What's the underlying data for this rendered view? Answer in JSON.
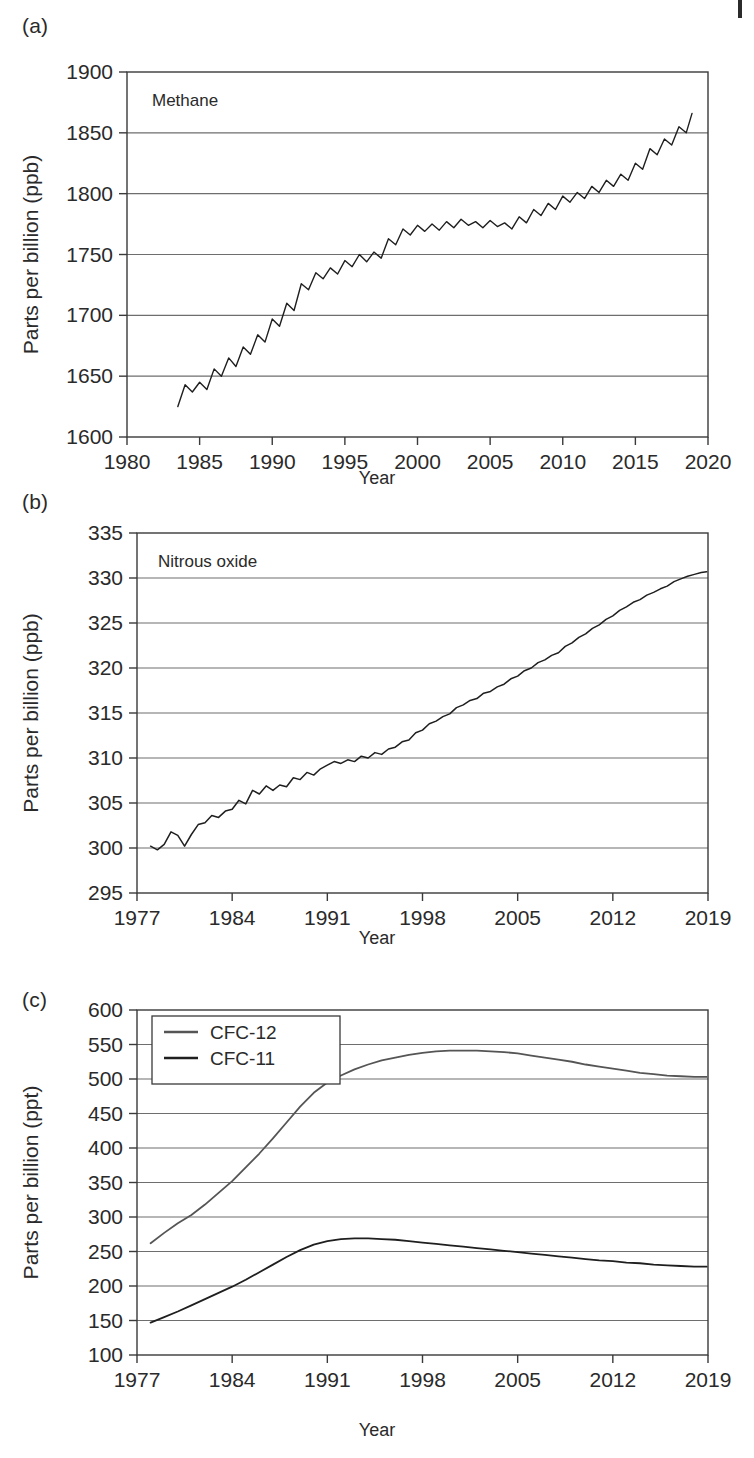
{
  "figure": {
    "panels": [
      {
        "label": "(a)",
        "annotation": "Methane",
        "xlabel": "Year",
        "ylabel": "Parts per billion (ppb)"
      },
      {
        "label": "(b)",
        "annotation": "Nitrous oxide",
        "xlabel": "Year",
        "ylabel": "Parts per billion (ppb)"
      },
      {
        "label": "(c)",
        "annotation": "",
        "xlabel": "Year",
        "ylabel": "Parts per billion (ppt)"
      }
    ]
  },
  "colors": {
    "axis": "#3a3a3a",
    "grid": "#6e6e6e",
    "series_dark": "#1f1f1f",
    "series_gray": "#555555",
    "text": "#2a2a2a"
  },
  "chart_data": [
    {
      "type": "line",
      "title": "Methane",
      "panel": "(a)",
      "xlabel": "Year",
      "ylabel": "Parts per billion (ppb)",
      "xlim": [
        1980,
        2020
      ],
      "ylim": [
        1600,
        1900
      ],
      "xticks": [
        1980,
        1985,
        1990,
        1995,
        2000,
        2005,
        2010,
        2015,
        2020
      ],
      "yticks": [
        1600,
        1650,
        1700,
        1750,
        1800,
        1850,
        1900
      ],
      "grid": "horizontal",
      "legend": "none",
      "series": [
        {
          "name": "Methane",
          "color": "#1f1f1f",
          "note": "monthly mean with seasonal cycle, amplitude approx 10 ppb",
          "x": [
            1983.5,
            1984.0,
            1984.5,
            1985.0,
            1985.5,
            1986.0,
            1986.5,
            1987.0,
            1987.5,
            1988.0,
            1988.5,
            1989.0,
            1989.5,
            1990.0,
            1990.5,
            1991.0,
            1991.5,
            1992.0,
            1992.5,
            1993.0,
            1993.5,
            1994.0,
            1994.5,
            1995.0,
            1995.5,
            1996.0,
            1996.5,
            1997.0,
            1997.5,
            1998.0,
            1998.5,
            1999.0,
            1999.5,
            2000.0,
            2000.5,
            2001.0,
            2001.5,
            2002.0,
            2002.5,
            2003.0,
            2003.5,
            2004.0,
            2004.5,
            2005.0,
            2005.5,
            2006.0,
            2006.5,
            2007.0,
            2007.5,
            2008.0,
            2008.5,
            2009.0,
            2009.5,
            2010.0,
            2010.5,
            2011.0,
            2011.5,
            2012.0,
            2012.5,
            2013.0,
            2013.5,
            2014.0,
            2014.5,
            2015.0,
            2015.5,
            2016.0,
            2016.5,
            2017.0,
            2017.5,
            2018.0,
            2018.5,
            2018.9
          ],
          "y": [
            1625,
            1643,
            1637,
            1645,
            1639,
            1656,
            1650,
            1665,
            1658,
            1674,
            1668,
            1684,
            1678,
            1697,
            1691,
            1710,
            1704,
            1726,
            1721,
            1735,
            1730,
            1739,
            1734,
            1745,
            1740,
            1750,
            1744,
            1752,
            1747,
            1763,
            1758,
            1771,
            1766,
            1774,
            1769,
            1775,
            1770,
            1777,
            1772,
            1779,
            1774,
            1777,
            1772,
            1778,
            1773,
            1776,
            1771,
            1781,
            1776,
            1787,
            1782,
            1792,
            1787,
            1798,
            1793,
            1801,
            1796,
            1806,
            1801,
            1811,
            1806,
            1816,
            1811,
            1825,
            1820,
            1837,
            1832,
            1845,
            1840,
            1855,
            1850,
            1866
          ]
        }
      ]
    },
    {
      "type": "line",
      "title": "Nitrous oxide",
      "panel": "(b)",
      "xlabel": "Year",
      "ylabel": "Parts per billion (ppb)",
      "xlim": [
        1977,
        2019
      ],
      "ylim": [
        295,
        335
      ],
      "xticks": [
        1977,
        1984,
        1991,
        1998,
        2005,
        2012,
        2019
      ],
      "yticks": [
        295,
        300,
        305,
        310,
        315,
        320,
        325,
        330,
        335
      ],
      "grid": "horizontal",
      "legend": "none",
      "series": [
        {
          "name": "Nitrous oxide",
          "color": "#1f1f1f",
          "note": "steadily rising with small seasonal wiggles",
          "x": [
            1978.0,
            1978.5,
            1979.0,
            1979.5,
            1980.0,
            1980.5,
            1981.0,
            1981.5,
            1982.0,
            1982.5,
            1983.0,
            1983.5,
            1984.0,
            1984.5,
            1985.0,
            1985.5,
            1986.0,
            1986.5,
            1987.0,
            1987.5,
            1988.0,
            1988.5,
            1989.0,
            1989.5,
            1990.0,
            1990.5,
            1991.0,
            1991.5,
            1992.0,
            1992.5,
            1993.0,
            1993.5,
            1994.0,
            1994.5,
            1995.0,
            1995.5,
            1996.0,
            1996.5,
            1997.0,
            1997.5,
            1998.0,
            1998.5,
            1999.0,
            1999.5,
            2000.0,
            2000.5,
            2001.0,
            2001.5,
            2002.0,
            2002.5,
            2003.0,
            2003.5,
            2004.0,
            2004.5,
            2005.0,
            2005.5,
            2006.0,
            2006.5,
            2007.0,
            2007.5,
            2008.0,
            2008.5,
            2009.0,
            2009.5,
            2010.0,
            2010.5,
            2011.0,
            2011.5,
            2012.0,
            2012.5,
            2013.0,
            2013.5,
            2014.0,
            2014.5,
            2015.0,
            2015.5,
            2016.0,
            2016.5,
            2017.0,
            2017.5,
            2018.0,
            2018.5,
            2018.9
          ],
          "y": [
            300.2,
            299.8,
            300.4,
            301.8,
            301.4,
            300.2,
            301.5,
            302.6,
            302.8,
            303.6,
            303.4,
            304.1,
            304.3,
            305.3,
            304.9,
            306.4,
            306.0,
            306.9,
            306.4,
            307.0,
            306.8,
            307.8,
            307.6,
            308.4,
            308.1,
            308.8,
            309.2,
            309.6,
            309.4,
            309.8,
            309.6,
            310.2,
            310.0,
            310.6,
            310.4,
            311.0,
            311.2,
            311.8,
            312.0,
            312.8,
            313.1,
            313.8,
            314.1,
            314.6,
            314.9,
            315.6,
            315.9,
            316.4,
            316.6,
            317.2,
            317.4,
            317.9,
            318.2,
            318.8,
            319.1,
            319.7,
            320.0,
            320.6,
            320.9,
            321.4,
            321.7,
            322.4,
            322.8,
            323.4,
            323.8,
            324.4,
            324.8,
            325.4,
            325.8,
            326.4,
            326.8,
            327.3,
            327.6,
            328.1,
            328.4,
            328.8,
            329.1,
            329.6,
            329.9,
            330.2,
            330.4,
            330.6,
            330.7
          ]
        }
      ]
    },
    {
      "type": "line",
      "title": "CFCs",
      "panel": "(c)",
      "xlabel": "Year",
      "ylabel": "Parts per billion (ppt)",
      "xlim": [
        1977,
        2019
      ],
      "ylim": [
        100,
        600
      ],
      "xticks": [
        1977,
        1984,
        1991,
        1998,
        2005,
        2012,
        2019
      ],
      "yticks": [
        100,
        150,
        200,
        250,
        300,
        350,
        400,
        450,
        500,
        550,
        600
      ],
      "grid": "horizontal",
      "legend": "top-left",
      "series": [
        {
          "name": "CFC-12",
          "color": "#555555",
          "x": [
            1978.0,
            1979.0,
            1980.0,
            1981.0,
            1982.0,
            1983.0,
            1984.0,
            1985.0,
            1986.0,
            1987.0,
            1988.0,
            1989.0,
            1990.0,
            1991.0,
            1992.0,
            1993.0,
            1994.0,
            1995.0,
            1996.0,
            1997.0,
            1998.0,
            1999.0,
            2000.0,
            2001.0,
            2002.0,
            2003.0,
            2004.0,
            2005.0,
            2006.0,
            2007.0,
            2008.0,
            2009.0,
            2010.0,
            2011.0,
            2012.0,
            2013.0,
            2014.0,
            2015.0,
            2016.0,
            2017.0,
            2018.0,
            2018.9
          ],
          "y": [
            262,
            277,
            291,
            303,
            318,
            335,
            352,
            372,
            392,
            414,
            437,
            460,
            480,
            495,
            505,
            514,
            521,
            527,
            531,
            535,
            538,
            540,
            541,
            541,
            541,
            540,
            539,
            537,
            534,
            531,
            528,
            525,
            521,
            518,
            515,
            512,
            509,
            507,
            505,
            504,
            503,
            503
          ]
        },
        {
          "name": "CFC-11",
          "color": "#1f1f1f",
          "x": [
            1978.0,
            1979.0,
            1980.0,
            1981.0,
            1982.0,
            1983.0,
            1984.0,
            1985.0,
            1986.0,
            1987.0,
            1988.0,
            1989.0,
            1990.0,
            1991.0,
            1992.0,
            1993.0,
            1994.0,
            1995.0,
            1996.0,
            1997.0,
            1998.0,
            1999.0,
            2000.0,
            2001.0,
            2002.0,
            2003.0,
            2004.0,
            2005.0,
            2006.0,
            2007.0,
            2008.0,
            2009.0,
            2010.0,
            2011.0,
            2012.0,
            2013.0,
            2014.0,
            2015.0,
            2016.0,
            2017.0,
            2018.0,
            2018.9
          ],
          "y": [
            147,
            155,
            163,
            172,
            181,
            190,
            199,
            209,
            220,
            231,
            242,
            252,
            260,
            265,
            268,
            269,
            269,
            268,
            267,
            265,
            263,
            261,
            259,
            257,
            255,
            253,
            251,
            249,
            247,
            245,
            243,
            241,
            239,
            237,
            236,
            234,
            233,
            231,
            230,
            229,
            228,
            228
          ]
        }
      ]
    }
  ]
}
